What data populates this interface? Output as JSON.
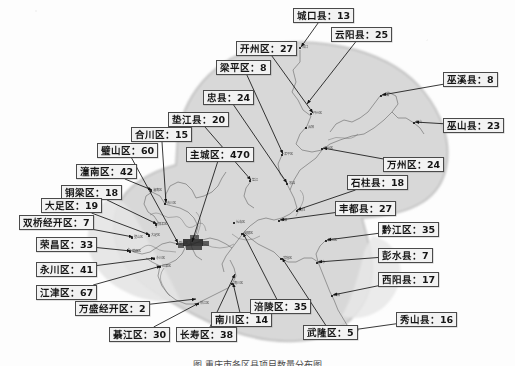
{
  "figure": {
    "caption": "图    重庆市各区县项目数量分布图",
    "map_title": "重庆市",
    "background_color": "#d8d8d8",
    "box_fill_color": "#f2f2f2",
    "box_border_color": "#4a4a4a",
    "line_color": "#1a1a1a"
  },
  "chart_data": {
    "type": "map",
    "unit": "个",
    "value_label_separator": "：",
    "categories": [
      "主城区",
      "江津区",
      "璧山区",
      "永川区",
      "长寿区",
      "黔江区",
      "涪陵区",
      "荣昌区",
      "綦江区",
      "开州区",
      "丰都县",
      "云阳县",
      "万州区",
      "巫山县",
      "忠县",
      "垫江县",
      "潼南区",
      "合川区",
      "铜梁区",
      "大足区",
      "石柱县",
      "西阳县",
      "秀山县",
      "南川区",
      "城口县",
      "巫溪县",
      "彭水县",
      "双桥经开区",
      "梁平区",
      "武隆区",
      "万盛经开区"
    ],
    "values": [
      470,
      67,
      60,
      41,
      38,
      35,
      35,
      33,
      30,
      27,
      27,
      25,
      24,
      23,
      24,
      20,
      42,
      15,
      18,
      19,
      18,
      17,
      16,
      14,
      13,
      8,
      7,
      7,
      8,
      5,
      2
    ],
    "total": 1118,
    "max": 470,
    "min": 2
  },
  "labels": [
    {
      "id": "chengkou",
      "name": "城口县",
      "value": 13,
      "text": "城口县：13",
      "box": {
        "x": 293,
        "y": 8
      },
      "anchor": {
        "x": 301,
        "y": 47
      }
    },
    {
      "id": "yunyang",
      "name": "云阳县",
      "value": 25,
      "text": "云阳县：25",
      "box": {
        "x": 331,
        "y": 27
      },
      "anchor": {
        "x": 307,
        "y": 104
      }
    },
    {
      "id": "wuxi",
      "name": "巫溪县",
      "value": 8,
      "text": "巫溪县：8",
      "box": {
        "x": 443,
        "y": 72
      },
      "anchor": {
        "x": 382,
        "y": 95
      }
    },
    {
      "id": "wushan",
      "name": "巫山县",
      "value": 23,
      "text": "巫山县：23",
      "box": {
        "x": 443,
        "y": 118
      },
      "anchor": {
        "x": 415,
        "y": 122
      }
    },
    {
      "id": "kaizhou",
      "name": "开州区",
      "value": 27,
      "text": "开州区：27",
      "box": {
        "x": 236,
        "y": 41
      },
      "anchor": {
        "x": 313,
        "y": 113
      }
    },
    {
      "id": "liangping",
      "name": "梁平区",
      "value": 8,
      "text": "梁平区：8",
      "box": {
        "x": 216,
        "y": 60
      },
      "anchor": {
        "x": 283,
        "y": 154
      }
    },
    {
      "id": "zhongxian",
      "name": "忠县",
      "value": 24,
      "text": "忠县：24",
      "box": {
        "x": 203,
        "y": 90
      },
      "anchor": {
        "x": 287,
        "y": 183
      }
    },
    {
      "id": "dianjiang",
      "name": "垫江县",
      "value": 20,
      "text": "垫江县：20",
      "box": {
        "x": 168,
        "y": 112
      },
      "anchor": {
        "x": 251,
        "y": 180
      }
    },
    {
      "id": "hechuan",
      "name": "合川区",
      "value": 15,
      "text": "合川区：15",
      "box": {
        "x": 131,
        "y": 127
      },
      "anchor": {
        "x": 166,
        "y": 203
      }
    },
    {
      "id": "zhucheng",
      "name": "主城区",
      "value": 470,
      "text": "主城区：470",
      "box": {
        "x": 186,
        "y": 147
      },
      "anchor": {
        "x": 192,
        "y": 242
      }
    },
    {
      "id": "bishan",
      "name": "璧山区",
      "value": 60,
      "text": "璧山区：60",
      "box": {
        "x": 97,
        "y": 143
      },
      "anchor": {
        "x": 178,
        "y": 243
      }
    },
    {
      "id": "tongnan",
      "name": "潼南区",
      "value": 42,
      "text": "潼南区：42",
      "box": {
        "x": 76,
        "y": 164
      },
      "anchor": {
        "x": 152,
        "y": 190
      }
    },
    {
      "id": "tongliang",
      "name": "铜梁区",
      "value": 18,
      "text": "铜梁区：18",
      "box": {
        "x": 61,
        "y": 185
      },
      "anchor": {
        "x": 157,
        "y": 224
      }
    },
    {
      "id": "dazu",
      "name": "大足区",
      "value": 19,
      "text": "大足区：19",
      "box": {
        "x": 41,
        "y": 198
      },
      "anchor": {
        "x": 150,
        "y": 235
      }
    },
    {
      "id": "shuangqiao",
      "name": "双桥经开区",
      "value": 7,
      "text": "双桥经开区：7",
      "box": {
        "x": 19,
        "y": 215
      },
      "anchor": {
        "x": 133,
        "y": 237
      }
    },
    {
      "id": "rongchang",
      "name": "荣昌区",
      "value": 33,
      "text": "荣昌区：33",
      "box": {
        "x": 36,
        "y": 237
      },
      "anchor": {
        "x": 131,
        "y": 251
      }
    },
    {
      "id": "yongchuan",
      "name": "永川区",
      "value": 41,
      "text": "永川区：41",
      "box": {
        "x": 36,
        "y": 262
      },
      "anchor": {
        "x": 155,
        "y": 258
      }
    },
    {
      "id": "jiangjin",
      "name": "江津区",
      "value": 67,
      "text": "江津区：67",
      "box": {
        "x": 36,
        "y": 285
      },
      "anchor": {
        "x": 161,
        "y": 266
      }
    },
    {
      "id": "wansheng",
      "name": "万盛经开区",
      "value": 2,
      "text": "万盛经开区：2",
      "box": {
        "x": 75,
        "y": 301
      },
      "anchor": {
        "x": 196,
        "y": 299
      }
    },
    {
      "id": "qijiang",
      "name": "綦江区",
      "value": 30,
      "text": "綦江区：30",
      "box": {
        "x": 109,
        "y": 327
      },
      "anchor": {
        "x": 199,
        "y": 303
      }
    },
    {
      "id": "changshou",
      "name": "长寿区",
      "value": 38,
      "text": "长寿区：38",
      "box": {
        "x": 176,
        "y": 327
      },
      "anchor": {
        "x": 235,
        "y": 274
      }
    },
    {
      "id": "nanchuan",
      "name": "南川区",
      "value": 14,
      "text": "南川区：14",
      "box": {
        "x": 211,
        "y": 312
      },
      "anchor": {
        "x": 233,
        "y": 283
      }
    },
    {
      "id": "fuling",
      "name": "涪陵区",
      "value": 35,
      "text": "涪陵区：35",
      "box": {
        "x": 250,
        "y": 299
      },
      "anchor": {
        "x": 243,
        "y": 233
      }
    },
    {
      "id": "wulong",
      "name": "武隆区",
      "value": 5,
      "text": "武隆区：5",
      "box": {
        "x": 303,
        "y": 325
      },
      "anchor": {
        "x": 282,
        "y": 258
      }
    },
    {
      "id": "xiushan",
      "name": "秀山县",
      "value": 16,
      "text": "秀山县：16",
      "box": {
        "x": 396,
        "y": 312
      },
      "anchor": {
        "x": 352,
        "y": 330
      }
    },
    {
      "id": "youyang",
      "name": "西阳县",
      "value": 17,
      "text": "西阳县：17",
      "box": {
        "x": 378,
        "y": 272
      },
      "anchor": {
        "x": 333,
        "y": 295
      }
    },
    {
      "id": "pengshui",
      "name": "彭水县",
      "value": 7,
      "text": "彭水县：7",
      "box": {
        "x": 378,
        "y": 248
      },
      "anchor": {
        "x": 318,
        "y": 262
      }
    },
    {
      "id": "qianjiang",
      "name": "黔江区",
      "value": 35,
      "text": "黔江区：35",
      "box": {
        "x": 378,
        "y": 222
      },
      "anchor": {
        "x": 327,
        "y": 240
      }
    },
    {
      "id": "fengdu",
      "name": "丰都县",
      "value": 27,
      "text": "丰都县：27",
      "box": {
        "x": 335,
        "y": 201
      },
      "anchor": {
        "x": 280,
        "y": 220
      }
    },
    {
      "id": "shizhu",
      "name": "石柱县",
      "value": 18,
      "text": "石柱县：18",
      "box": {
        "x": 347,
        "y": 175
      },
      "anchor": {
        "x": 297,
        "y": 210
      }
    },
    {
      "id": "wanzhou",
      "name": "万州区",
      "value": 24,
      "text": "万州区：24",
      "box": {
        "x": 383,
        "y": 157
      },
      "anchor": {
        "x": 323,
        "y": 148
      }
    }
  ],
  "map_points": [
    {
      "label": "城口",
      "x": 300,
      "y": 48
    },
    {
      "label": "开州区",
      "x": 311,
      "y": 114
    },
    {
      "label": "梁平区",
      "x": 282,
      "y": 155
    },
    {
      "label": "忠县",
      "x": 287,
      "y": 184
    },
    {
      "label": "垫江",
      "x": 250,
      "y": 181
    },
    {
      "label": "巫溪",
      "x": 381,
      "y": 96
    },
    {
      "label": "巫山",
      "x": 414,
      "y": 123
    },
    {
      "label": "云阳",
      "x": 306,
      "y": 128
    },
    {
      "label": "万州区",
      "x": 322,
      "y": 149
    },
    {
      "label": "石柱",
      "x": 297,
      "y": 211
    },
    {
      "label": "丰都",
      "x": 279,
      "y": 221
    },
    {
      "label": "黔江区",
      "x": 326,
      "y": 241
    },
    {
      "label": "彭水",
      "x": 317,
      "y": 263
    },
    {
      "label": "西阳",
      "x": 332,
      "y": 296
    },
    {
      "label": "秀山",
      "x": 351,
      "y": 331
    },
    {
      "label": "武隆区",
      "x": 281,
      "y": 259
    },
    {
      "label": "涪陵区",
      "x": 242,
      "y": 234
    },
    {
      "label": "长寿区",
      "x": 234,
      "y": 223
    },
    {
      "label": "南川区",
      "x": 232,
      "y": 284
    },
    {
      "label": "綦江区",
      "x": 198,
      "y": 304
    },
    {
      "label": "江津区",
      "x": 160,
      "y": 267
    },
    {
      "label": "合川区",
      "x": 165,
      "y": 204
    },
    {
      "label": "潼南区",
      "x": 151,
      "y": 191
    },
    {
      "label": "铜梁区",
      "x": 156,
      "y": 225
    },
    {
      "label": "大足区",
      "x": 149,
      "y": 236
    },
    {
      "label": "荣昌区",
      "x": 130,
      "y": 252
    },
    {
      "label": "永川区",
      "x": 154,
      "y": 259
    },
    {
      "label": "璧山区",
      "x": 177,
      "y": 244
    },
    {
      "label": "壁山区",
      "x": 132,
      "y": 238
    }
  ]
}
